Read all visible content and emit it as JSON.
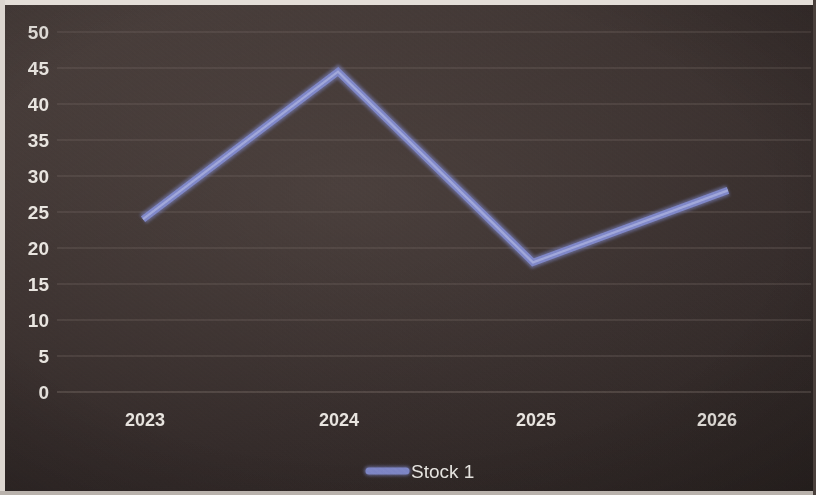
{
  "chart_data": {
    "type": "line",
    "title": "",
    "subtitle": "",
    "xlabel": "",
    "ylabel": "",
    "categories": [
      "2023",
      "2024",
      "2025",
      "2026"
    ],
    "series": [
      {
        "name": "Stock 1",
        "color": "#8189c9",
        "values": [
          24,
          44.5,
          18,
          28
        ]
      }
    ],
    "ylim": [
      0,
      50
    ],
    "y_ticks": [
      "0",
      "5",
      "10",
      "15",
      "20",
      "25",
      "30",
      "35",
      "40",
      "45",
      "50"
    ],
    "y_tick_values": [
      0,
      5,
      10,
      15,
      20,
      25,
      30,
      35,
      40,
      45,
      50
    ],
    "x_tick_labels": [
      "2023",
      "2024",
      "2025",
      "2026"
    ],
    "grid": "horizontal",
    "legend": {
      "position": "bottom-center",
      "entries": [
        {
          "label": "Stock 1",
          "color": "#8189c9",
          "marker": "line"
        }
      ]
    },
    "background_color": "#3a3230",
    "text_color": "#e9e5e0",
    "gridline_color": "#6c615c"
  }
}
